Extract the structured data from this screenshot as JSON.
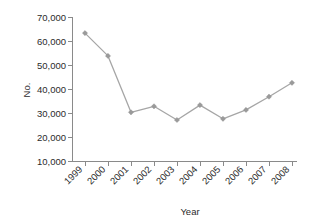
{
  "chart_data": {
    "type": "line",
    "title": "",
    "subtitle": "",
    "xlabel": "Year",
    "ylabel": "No.",
    "categories": [
      "1999",
      "2000",
      "2001",
      "2002",
      "2003",
      "2004",
      "2005",
      "2006",
      "2007",
      "2008"
    ],
    "values": [
      63500,
      54000,
      30500,
      33000,
      27300,
      33500,
      27800,
      31500,
      37000,
      42800
    ],
    "series": [
      {
        "name": "No.",
        "values": [
          63500,
          54000,
          30500,
          33000,
          27300,
          33500,
          27800,
          31500,
          37000,
          42800
        ]
      }
    ],
    "ylim": [
      10000,
      70000
    ],
    "ytick_labels": [
      "10,000",
      "20,000",
      "30,000",
      "40,000",
      "50,000",
      "60,000",
      "70,000"
    ],
    "ytick_values": [
      10000,
      20000,
      30000,
      40000,
      50000,
      60000,
      70000
    ],
    "xtick_labels": [
      "1999",
      "2000",
      "2001",
      "2002",
      "2003",
      "2004",
      "2005",
      "2006",
      "2007",
      "2008"
    ],
    "xtick_rotation": "45",
    "grid": false,
    "legend": false,
    "legend_position": "none",
    "marker": "diamond",
    "line_color": "#a6a6a6",
    "marker_color": "#9a9a9a",
    "axis_color": "#8a8a8a",
    "background_color": "#ffffff"
  },
  "axis": {
    "y_title": "No.",
    "x_title": "Year"
  }
}
